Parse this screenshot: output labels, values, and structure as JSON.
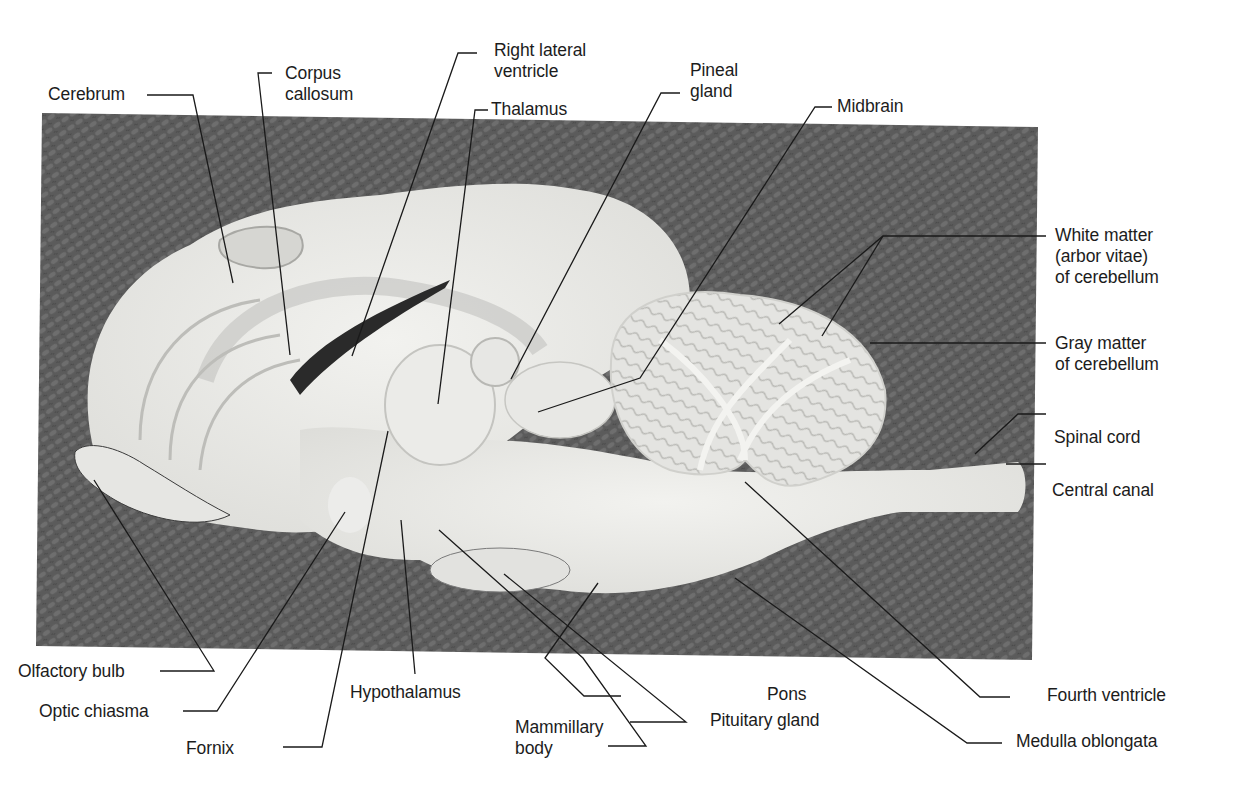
{
  "figure": {
    "caption_fragment": "",
    "photo": {
      "description": "Midsagittal section of sheep brain on textured dark cloth",
      "background_color": "#5a5a5a",
      "tissue_color": "#e9e9e6"
    },
    "labels": [
      {
        "id": "cerebrum",
        "lines": [
          "Cerebrum"
        ]
      },
      {
        "id": "corpus-callosum",
        "lines": [
          "Corpus",
          "callosum"
        ]
      },
      {
        "id": "right-lateral-ventricle",
        "lines": [
          "Right lateral",
          "ventricle"
        ]
      },
      {
        "id": "thalamus",
        "lines": [
          "Thalamus"
        ]
      },
      {
        "id": "pineal-gland",
        "lines": [
          "Pineal",
          "gland"
        ]
      },
      {
        "id": "midbrain",
        "lines": [
          "Midbrain"
        ]
      },
      {
        "id": "white-matter",
        "lines": [
          "White matter",
          "(arbor vitae)",
          "of cerebellum"
        ]
      },
      {
        "id": "gray-matter",
        "lines": [
          "Gray matter",
          "of cerebellum"
        ]
      },
      {
        "id": "spinal-cord",
        "lines": [
          "Spinal cord"
        ]
      },
      {
        "id": "central-canal",
        "lines": [
          "Central canal"
        ]
      },
      {
        "id": "olfactory-bulb",
        "lines": [
          "Olfactory bulb"
        ]
      },
      {
        "id": "optic-chiasma",
        "lines": [
          "Optic chiasma"
        ]
      },
      {
        "id": "fornix",
        "lines": [
          "Fornix"
        ]
      },
      {
        "id": "hypothalamus",
        "lines": [
          "Hypothalamus"
        ]
      },
      {
        "id": "mammillary-body",
        "lines": [
          "Mammillary",
          "body"
        ]
      },
      {
        "id": "pituitary-gland",
        "lines": [
          "Pituitary gland"
        ]
      },
      {
        "id": "pons",
        "lines": [
          "Pons"
        ]
      },
      {
        "id": "fourth-ventricle",
        "lines": [
          "Fourth ventricle"
        ]
      },
      {
        "id": "medulla-oblongata",
        "lines": [
          "Medulla oblongata"
        ]
      }
    ]
  }
}
